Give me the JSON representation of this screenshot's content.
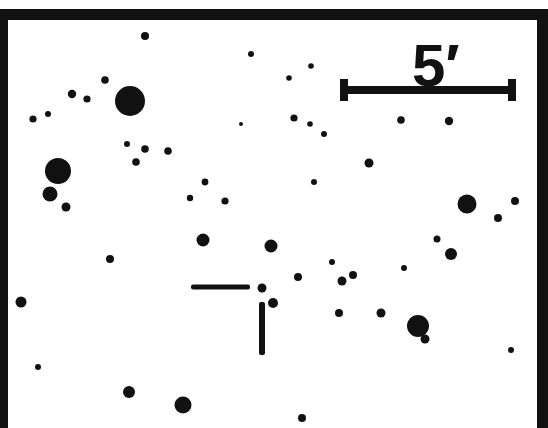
{
  "finding_chart": {
    "colors": {
      "background": "#ffffff",
      "ink": "#111111"
    },
    "frame": {
      "x": 0,
      "y": 9,
      "width": 548,
      "height": 440,
      "border_left": 8,
      "border_top": 11,
      "border_right": 11
    },
    "scale_bar": {
      "label": "5′",
      "label_value": 5,
      "label_unit": "arcmin",
      "x1": 344,
      "x2": 512,
      "y": 90,
      "thickness": 8,
      "cap_height": 22,
      "cap_width": 8,
      "label_x": 412,
      "label_y": 86,
      "label_size": 60
    },
    "target_marker": {
      "target": {
        "x": 262,
        "y": 288,
        "r": 4.5
      },
      "horizontal_tick": {
        "x1": 191,
        "x2": 250,
        "y": 287,
        "thickness": 5
      },
      "vertical_tick": {
        "x": 262,
        "y1": 302,
        "y2": 355,
        "thickness": 6
      }
    },
    "stars": [
      {
        "x": 145,
        "y": 36,
        "r": 4
      },
      {
        "x": 251,
        "y": 54,
        "r": 3
      },
      {
        "x": 311,
        "y": 66,
        "r": 2.8
      },
      {
        "x": 289,
        "y": 78,
        "r": 2.8
      },
      {
        "x": 105,
        "y": 80,
        "r": 3.8
      },
      {
        "x": 72,
        "y": 94,
        "r": 4.2
      },
      {
        "x": 87,
        "y": 99,
        "r": 3.6
      },
      {
        "x": 130,
        "y": 101,
        "r": 15
      },
      {
        "x": 48,
        "y": 114,
        "r": 3
      },
      {
        "x": 33,
        "y": 119,
        "r": 3.6
      },
      {
        "x": 241,
        "y": 124,
        "r": 2
      },
      {
        "x": 294,
        "y": 118,
        "r": 3.6
      },
      {
        "x": 310,
        "y": 124,
        "r": 2.8
      },
      {
        "x": 324,
        "y": 134,
        "r": 3
      },
      {
        "x": 401,
        "y": 120,
        "r": 3.8
      },
      {
        "x": 449,
        "y": 121,
        "r": 4.2
      },
      {
        "x": 127,
        "y": 144,
        "r": 3
      },
      {
        "x": 145,
        "y": 149,
        "r": 3.8
      },
      {
        "x": 168,
        "y": 151,
        "r": 3.8
      },
      {
        "x": 136,
        "y": 162,
        "r": 3.8
      },
      {
        "x": 369,
        "y": 163,
        "r": 4.5
      },
      {
        "x": 58,
        "y": 171,
        "r": 13
      },
      {
        "x": 205,
        "y": 182,
        "r": 3.4
      },
      {
        "x": 314,
        "y": 182,
        "r": 3
      },
      {
        "x": 50,
        "y": 194,
        "r": 7.5
      },
      {
        "x": 190,
        "y": 198,
        "r": 3.2
      },
      {
        "x": 225,
        "y": 201,
        "r": 3.6
      },
      {
        "x": 515,
        "y": 201,
        "r": 4
      },
      {
        "x": 467,
        "y": 204,
        "r": 9.5
      },
      {
        "x": 66,
        "y": 207,
        "r": 4.5
      },
      {
        "x": 498,
        "y": 218,
        "r": 4
      },
      {
        "x": 437,
        "y": 239,
        "r": 3.5
      },
      {
        "x": 203,
        "y": 240,
        "r": 6.5
      },
      {
        "x": 271,
        "y": 246,
        "r": 6.5
      },
      {
        "x": 451,
        "y": 254,
        "r": 6
      },
      {
        "x": 110,
        "y": 259,
        "r": 4
      },
      {
        "x": 332,
        "y": 262,
        "r": 3
      },
      {
        "x": 404,
        "y": 268,
        "r": 3
      },
      {
        "x": 353,
        "y": 275,
        "r": 4
      },
      {
        "x": 298,
        "y": 277,
        "r": 4
      },
      {
        "x": 342,
        "y": 281,
        "r": 4.5
      },
      {
        "x": 21,
        "y": 302,
        "r": 5.5
      },
      {
        "x": 273,
        "y": 303,
        "r": 5
      },
      {
        "x": 339,
        "y": 313,
        "r": 4
      },
      {
        "x": 381,
        "y": 313,
        "r": 4.5
      },
      {
        "x": 418,
        "y": 326,
        "r": 11
      },
      {
        "x": 425,
        "y": 339,
        "r": 4.5
      },
      {
        "x": 511,
        "y": 350,
        "r": 3
      },
      {
        "x": 38,
        "y": 367,
        "r": 3
      },
      {
        "x": 129,
        "y": 392,
        "r": 6
      },
      {
        "x": 183,
        "y": 405,
        "r": 8.5
      },
      {
        "x": 302,
        "y": 418,
        "r": 4
      }
    ]
  }
}
